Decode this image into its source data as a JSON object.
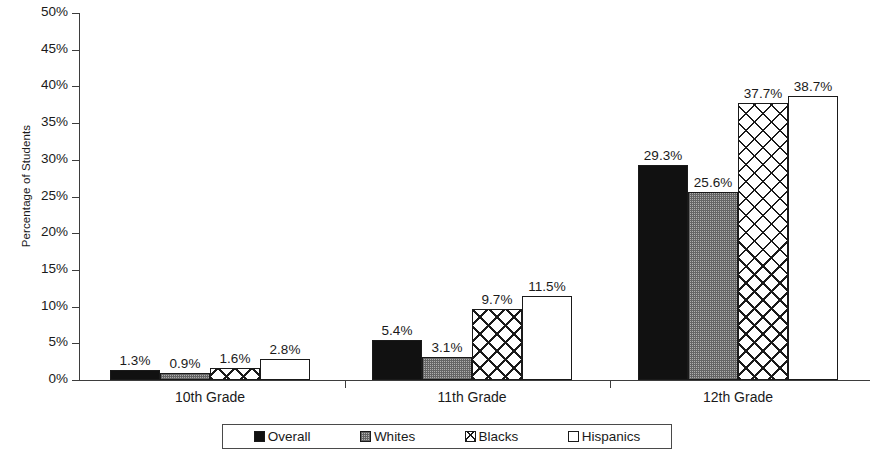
{
  "chart_data": {
    "type": "bar",
    "title": "",
    "subtitle": "",
    "xlabel": "",
    "ylabel": "Percentage of Students",
    "categories": [
      "10th Grade",
      "11th Grade",
      "12th Grade"
    ],
    "series": [
      {
        "name": "Overall",
        "pattern": "solid-black",
        "values": [
          1.3,
          5.4,
          29.3
        ],
        "labels": [
          "1.3%",
          "5.4%",
          "29.3%"
        ]
      },
      {
        "name": "Whites",
        "pattern": "gray-dither",
        "values": [
          0.9,
          3.1,
          25.6
        ],
        "labels": [
          "0.9%",
          "3.1%",
          "25.6%"
        ]
      },
      {
        "name": "Blacks",
        "pattern": "crosshatch",
        "values": [
          1.6,
          9.7,
          37.7
        ],
        "labels": [
          "1.6%",
          "9.7%",
          "37.7%"
        ]
      },
      {
        "name": "Hispanics",
        "pattern": "white-outline",
        "values": [
          2.8,
          11.5,
          38.7
        ],
        "labels": [
          "2.8%",
          "11.5%",
          "38.7%"
        ]
      }
    ],
    "ylim": [
      0,
      50
    ],
    "ytick_step": 5,
    "ytick_labels": [
      "50%",
      "45%",
      "40%",
      "35%",
      "30%",
      "25%",
      "20%",
      "15%",
      "10%",
      "5%",
      "0%"
    ],
    "ytick_values": [
      50,
      45,
      40,
      35,
      30,
      25,
      20,
      15,
      10,
      5,
      0
    ],
    "grid": false,
    "legend_position": "bottom",
    "legend_entries": [
      "Overall",
      "Whites",
      "Blacks",
      "Hispanics"
    ]
  }
}
